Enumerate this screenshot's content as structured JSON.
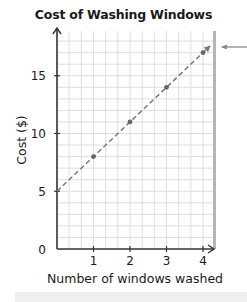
{
  "chart_data": {
    "type": "line",
    "title": "Cost of Washing Windows",
    "xlabel": "Number of windows washed",
    "ylabel": "Cost ($)",
    "x_ticks": [
      "1",
      "2",
      "3",
      "4"
    ],
    "y_ticks": [
      "0",
      "5",
      "10",
      "15"
    ],
    "xlim": [
      0,
      4.3
    ],
    "ylim": [
      0,
      18
    ],
    "grid": true,
    "line_style": "dashed",
    "line_arrow_end": true,
    "series": [
      {
        "name": "Cost",
        "x": [
          0,
          1,
          2,
          3,
          4
        ],
        "y": [
          5,
          8,
          11,
          14,
          17
        ],
        "marker": "dot",
        "color": "#707070"
      }
    ],
    "annotations": [
      "pointer arrow at right edge near top of line"
    ]
  },
  "colors": {
    "grid": "#dedede",
    "axis": "#333333",
    "line": "#7a7a7a",
    "marker": "#666666",
    "right_bar": "#b5b5b5",
    "footer_bar": "#efefef"
  }
}
